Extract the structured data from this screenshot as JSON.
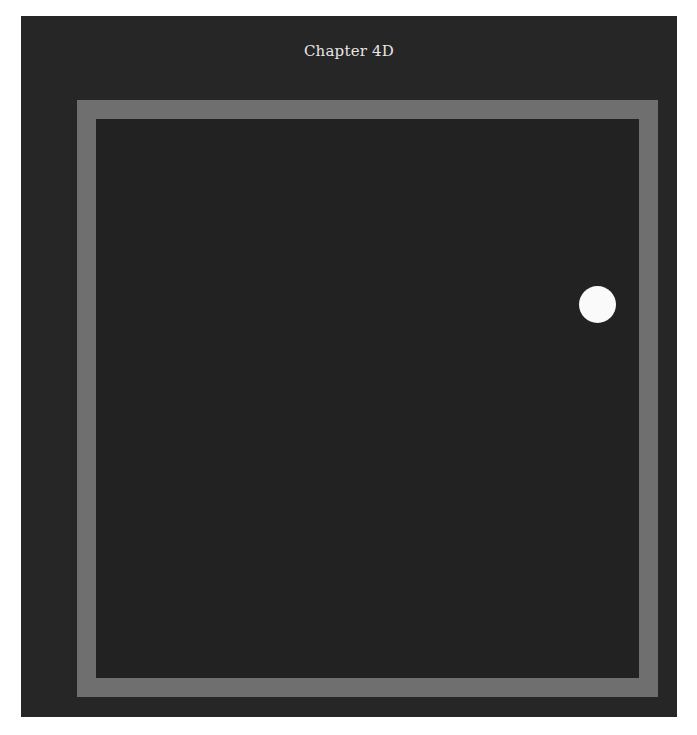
{
  "game": {
    "title": "Chapter 4D",
    "colors": {
      "background": "#262626",
      "wall": "#6f6f6f",
      "ball": "#fafafa",
      "title_text": "#e6e6e6"
    },
    "ball": {
      "shape": "circle",
      "x": 596,
      "y": 303,
      "diameter": 37
    }
  }
}
